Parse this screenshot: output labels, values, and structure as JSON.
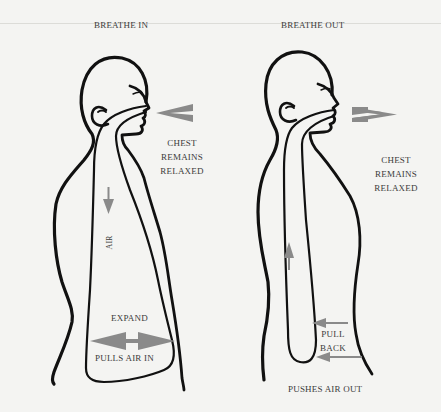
{
  "diagram": {
    "panels": [
      {
        "id": "breathe-in",
        "title": "BREATHE IN",
        "mouth_arrow_direction": "inward",
        "chest_note": [
          "CHEST",
          "REMAINS",
          "RELAXED"
        ],
        "air_label": "AIR",
        "air_arrow_direction": "down",
        "belly_label_top": "EXPAND",
        "belly_label_bottom": "PULLS AIR IN",
        "belly_arrow": "double-horizontal"
      },
      {
        "id": "breathe-out",
        "title": "BREATHE OUT",
        "mouth_arrow_direction": "outward",
        "chest_note": [
          "CHEST",
          "REMAINS",
          "RELAXED"
        ],
        "air_arrow_direction": "up",
        "belly_label": [
          "PULL",
          "BACK"
        ],
        "belly_arrows": "two-left-pointing",
        "bottom_label": "PUSHES AIR OUT"
      }
    ],
    "colors": {
      "outline": "#111111",
      "arrow": "#8a8a8a",
      "text": "#3b3b3b",
      "background": "#f4f4f2"
    }
  }
}
